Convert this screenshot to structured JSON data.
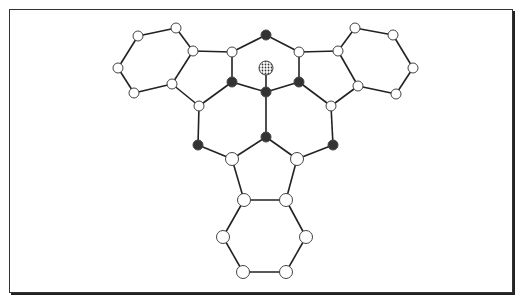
{
  "diagram": {
    "type": "molecular-structure",
    "colors": {
      "bond": "#222222",
      "white_atom_fill": "#ffffff",
      "dark_atom_fill": "#333333",
      "atom_stroke": "#444444",
      "dotted_atom_fill": "#cccccc"
    },
    "atoms": [
      {
        "id": "L1",
        "x": 138,
        "y": 36,
        "kind": "white"
      },
      {
        "id": "L2",
        "x": 176,
        "y": 28,
        "kind": "white"
      },
      {
        "id": "L3",
        "x": 193,
        "y": 51,
        "kind": "white"
      },
      {
        "id": "L4",
        "x": 172,
        "y": 84,
        "kind": "white"
      },
      {
        "id": "L5",
        "x": 134,
        "y": 93,
        "kind": "white"
      },
      {
        "id": "L6",
        "x": 118,
        "y": 68,
        "kind": "white"
      },
      {
        "id": "T1",
        "x": 266,
        "y": 35,
        "kind": "dark"
      },
      {
        "id": "T2",
        "x": 232,
        "y": 52,
        "kind": "white"
      },
      {
        "id": "T3",
        "x": 299,
        "y": 52,
        "kind": "white"
      },
      {
        "id": "Q",
        "x": 266,
        "y": 68,
        "kind": "dotted"
      },
      {
        "id": "D1",
        "x": 232,
        "y": 82,
        "kind": "dark"
      },
      {
        "id": "D2",
        "x": 266,
        "y": 92,
        "kind": "dark"
      },
      {
        "id": "D3",
        "x": 299,
        "y": 82,
        "kind": "dark"
      },
      {
        "id": "R1",
        "x": 355,
        "y": 28,
        "kind": "white"
      },
      {
        "id": "R2",
        "x": 393,
        "y": 35,
        "kind": "white"
      },
      {
        "id": "R3",
        "x": 413,
        "y": 68,
        "kind": "white"
      },
      {
        "id": "R4",
        "x": 396,
        "y": 94,
        "kind": "white"
      },
      {
        "id": "R5",
        "x": 358,
        "y": 86,
        "kind": "white"
      },
      {
        "id": "R6",
        "x": 338,
        "y": 51,
        "kind": "white"
      },
      {
        "id": "M1",
        "x": 199,
        "y": 106,
        "kind": "white"
      },
      {
        "id": "M2",
        "x": 331,
        "y": 106,
        "kind": "white"
      },
      {
        "id": "M3",
        "x": 198,
        "y": 145,
        "kind": "dark"
      },
      {
        "id": "M4",
        "x": 266,
        "y": 137,
        "kind": "dark"
      },
      {
        "id": "M5",
        "x": 333,
        "y": 145,
        "kind": "dark"
      },
      {
        "id": "M6",
        "x": 232,
        "y": 159,
        "kind": "white"
      },
      {
        "id": "M7",
        "x": 297,
        "y": 159,
        "kind": "white"
      },
      {
        "id": "B1",
        "x": 244,
        "y": 200,
        "kind": "white"
      },
      {
        "id": "B2",
        "x": 286,
        "y": 200,
        "kind": "white"
      },
      {
        "id": "B3",
        "x": 306,
        "y": 237,
        "kind": "white"
      },
      {
        "id": "B4",
        "x": 286,
        "y": 272,
        "kind": "white"
      },
      {
        "id": "B5",
        "x": 243,
        "y": 272,
        "kind": "white"
      },
      {
        "id": "B6",
        "x": 223,
        "y": 237,
        "kind": "white"
      }
    ],
    "bonds": [
      [
        "L1",
        "L2"
      ],
      [
        "L2",
        "L3"
      ],
      [
        "L3",
        "L4"
      ],
      [
        "L4",
        "L5"
      ],
      [
        "L5",
        "L6"
      ],
      [
        "L6",
        "L1"
      ],
      [
        "L3",
        "T2"
      ],
      [
        "L4",
        "M1"
      ],
      [
        "T2",
        "T1"
      ],
      [
        "T1",
        "T3"
      ],
      [
        "T2",
        "D1"
      ],
      [
        "T3",
        "D3"
      ],
      [
        "D1",
        "D2"
      ],
      [
        "D2",
        "D3"
      ],
      [
        "Q",
        "D2"
      ],
      [
        "R1",
        "R2"
      ],
      [
        "R2",
        "R3"
      ],
      [
        "R3",
        "R4"
      ],
      [
        "R4",
        "R5"
      ],
      [
        "R5",
        "R6"
      ],
      [
        "R6",
        "R1"
      ],
      [
        "R6",
        "T3"
      ],
      [
        "R5",
        "M2"
      ],
      [
        "D1",
        "M1"
      ],
      [
        "D3",
        "M2"
      ],
      [
        "M1",
        "M3"
      ],
      [
        "M2",
        "M5"
      ],
      [
        "D2",
        "M4"
      ],
      [
        "M3",
        "M6"
      ],
      [
        "M4",
        "M6"
      ],
      [
        "M4",
        "M7"
      ],
      [
        "M5",
        "M7"
      ],
      [
        "M6",
        "B1"
      ],
      [
        "M7",
        "B2"
      ],
      [
        "B1",
        "B2"
      ],
      [
        "B2",
        "B3"
      ],
      [
        "B3",
        "B4"
      ],
      [
        "B4",
        "B5"
      ],
      [
        "B5",
        "B6"
      ],
      [
        "B6",
        "B1"
      ]
    ]
  }
}
